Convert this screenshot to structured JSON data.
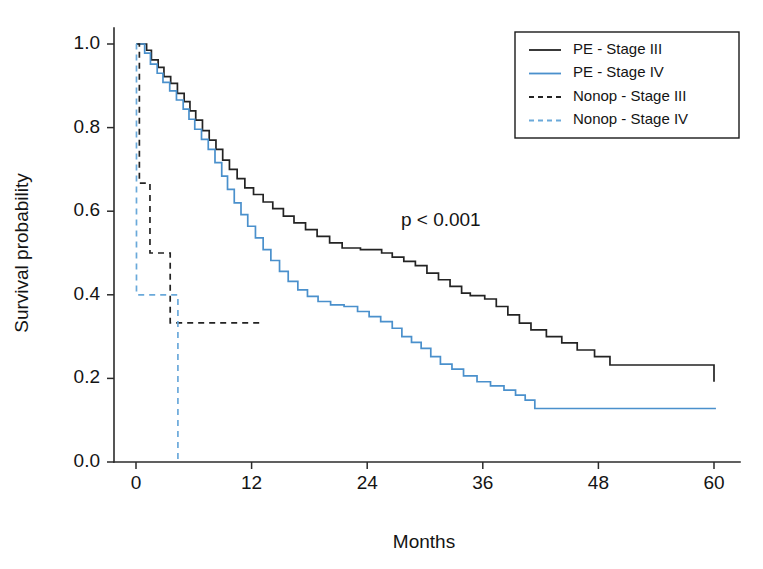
{
  "chart_data": {
    "type": "line",
    "subtype": "kaplan-meier-step",
    "title": "",
    "xlabel": "Months",
    "ylabel": "Survival probability",
    "xlim": [
      0,
      62
    ],
    "ylim": [
      0.0,
      1.0
    ],
    "xticks": [
      0,
      12,
      24,
      36,
      48,
      60
    ],
    "xtick_labels": [
      "0",
      "12",
      "24",
      "36",
      "48",
      "60"
    ],
    "yticks": [
      0.0,
      0.2,
      0.4,
      0.6,
      0.8,
      1.0
    ],
    "ytick_labels": [
      "0.0",
      "0.2",
      "0.4",
      "0.6",
      "0.8",
      "1.0"
    ],
    "grid": false,
    "legend_position": "top-right",
    "annotations": [
      {
        "text": "p < 0.001",
        "x": 27.5,
        "y": 0.565
      }
    ],
    "series": [
      {
        "name": "PE - Stage III",
        "color": "#232323",
        "style": "solid",
        "points": [
          [
            0.0,
            1.0
          ],
          [
            1.1,
            0.985
          ],
          [
            1.6,
            0.962
          ],
          [
            2.3,
            0.944
          ],
          [
            2.9,
            0.922
          ],
          [
            3.6,
            0.906
          ],
          [
            4.3,
            0.882
          ],
          [
            5.0,
            0.862
          ],
          [
            5.6,
            0.84
          ],
          [
            6.2,
            0.818
          ],
          [
            6.9,
            0.793
          ],
          [
            7.6,
            0.77
          ],
          [
            8.3,
            0.748
          ],
          [
            9.0,
            0.722
          ],
          [
            9.7,
            0.7
          ],
          [
            10.5,
            0.678
          ],
          [
            11.3,
            0.656
          ],
          [
            12.2,
            0.64
          ],
          [
            13.2,
            0.622
          ],
          [
            14.2,
            0.606
          ],
          [
            15.3,
            0.588
          ],
          [
            16.4,
            0.572
          ],
          [
            17.6,
            0.556
          ],
          [
            18.8,
            0.54
          ],
          [
            20.1,
            0.524
          ],
          [
            21.4,
            0.512
          ],
          [
            23.3,
            0.508
          ],
          [
            25.5,
            0.5
          ],
          [
            26.6,
            0.49
          ],
          [
            27.8,
            0.48
          ],
          [
            29.0,
            0.47
          ],
          [
            30.2,
            0.452
          ],
          [
            31.4,
            0.436
          ],
          [
            32.6,
            0.42
          ],
          [
            33.8,
            0.404
          ],
          [
            34.7,
            0.398
          ],
          [
            36.2,
            0.39
          ],
          [
            37.4,
            0.372
          ],
          [
            38.6,
            0.352
          ],
          [
            39.8,
            0.332
          ],
          [
            41.0,
            0.316
          ],
          [
            42.6,
            0.3
          ],
          [
            44.2,
            0.285
          ],
          [
            45.8,
            0.268
          ],
          [
            47.6,
            0.252
          ],
          [
            49.2,
            0.232
          ],
          [
            59.6,
            0.232
          ],
          [
            60.0,
            0.192
          ]
        ],
        "end_value": 0.192,
        "plateau_value": 0.232
      },
      {
        "name": "PE - Stage IV",
        "color": "#4a90cc",
        "style": "solid",
        "points": [
          [
            0.0,
            1.0
          ],
          [
            0.9,
            0.978
          ],
          [
            1.5,
            0.952
          ],
          [
            2.2,
            0.93
          ],
          [
            2.8,
            0.908
          ],
          [
            3.5,
            0.888
          ],
          [
            4.2,
            0.866
          ],
          [
            4.9,
            0.844
          ],
          [
            5.5,
            0.82
          ],
          [
            6.1,
            0.796
          ],
          [
            6.8,
            0.772
          ],
          [
            7.5,
            0.748
          ],
          [
            8.2,
            0.716
          ],
          [
            8.9,
            0.684
          ],
          [
            9.5,
            0.652
          ],
          [
            10.2,
            0.62
          ],
          [
            10.9,
            0.592
          ],
          [
            11.6,
            0.564
          ],
          [
            12.4,
            0.536
          ],
          [
            13.2,
            0.508
          ],
          [
            14.0,
            0.482
          ],
          [
            14.9,
            0.456
          ],
          [
            15.8,
            0.432
          ],
          [
            16.8,
            0.412
          ],
          [
            17.8,
            0.396
          ],
          [
            18.9,
            0.384
          ],
          [
            20.2,
            0.376
          ],
          [
            21.6,
            0.372
          ],
          [
            23.0,
            0.36
          ],
          [
            24.2,
            0.348
          ],
          [
            25.4,
            0.336
          ],
          [
            26.6,
            0.32
          ],
          [
            27.6,
            0.3
          ],
          [
            28.6,
            0.286
          ],
          [
            29.6,
            0.272
          ],
          [
            30.6,
            0.252
          ],
          [
            31.6,
            0.234
          ],
          [
            32.8,
            0.222
          ],
          [
            34.0,
            0.206
          ],
          [
            35.4,
            0.192
          ],
          [
            36.8,
            0.182
          ],
          [
            38.2,
            0.172
          ],
          [
            39.4,
            0.16
          ],
          [
            40.4,
            0.148
          ],
          [
            41.4,
            0.128
          ],
          [
            60.2,
            0.128
          ]
        ],
        "end_value": 0.128,
        "plateau_value": 0.128
      },
      {
        "name": "Nonop - Stage III",
        "color": "#232323",
        "style": "dashed",
        "points": [
          [
            0.0,
            1.0
          ],
          [
            0.35,
            0.667
          ],
          [
            1.45,
            0.5
          ],
          [
            3.55,
            0.333
          ],
          [
            13.1,
            0.333
          ]
        ],
        "end_value": 0.333,
        "plateau_value": 0.333
      },
      {
        "name": "Nonop - Stage IV",
        "color": "#6aa9da",
        "style": "dashed",
        "points": [
          [
            0.0,
            1.0
          ],
          [
            0.05,
            0.4
          ],
          [
            4.3,
            0.4
          ],
          [
            4.35,
            0.0
          ]
        ],
        "end_value": 0.0,
        "plateau_value": 0.4
      }
    ],
    "legend": [
      {
        "label": "PE - Stage III",
        "color": "#232323",
        "style": "solid"
      },
      {
        "label": "PE - Stage IV",
        "color": "#4a90cc",
        "style": "solid"
      },
      {
        "label": "Nonop - Stage III",
        "color": "#232323",
        "style": "dashed"
      },
      {
        "label": "Nonop - Stage IV",
        "color": "#6aa9da",
        "style": "dashed"
      }
    ]
  },
  "colors": {
    "axis": "#2b2b2b",
    "text": "#141414",
    "background": "#ffffff",
    "stage3": "#232323",
    "stage4": "#4a90cc",
    "stage4_light": "#6aa9da"
  }
}
